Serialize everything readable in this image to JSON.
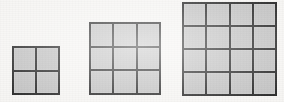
{
  "figure": {
    "background_color": "#f6f5f3",
    "line_color": "#262626",
    "cell_fill_color": "#c2c2c2",
    "cell_size_px": 24,
    "line_width_px": 2,
    "baseline_y_px": 95
  },
  "chart_data": {
    "type": "diagram",
    "categories": [
      "Figure 1",
      "Figure 2",
      "Figure 3"
    ],
    "values": [
      4,
      9,
      16
    ],
    "xlabel": "",
    "ylabel": "Number of small squares",
    "grid": true,
    "legend": false,
    "shapes": [
      {
        "name": "grid-2x2",
        "label": "Figure 1",
        "rows": 2,
        "columns": 2,
        "cell_count": 4,
        "side_length_cells": 2,
        "x_px": 12,
        "y_px": 46,
        "width_px": 48,
        "height_px": 49
      },
      {
        "name": "grid-3x3",
        "label": "Figure 2",
        "rows": 3,
        "columns": 3,
        "cell_count": 9,
        "side_length_cells": 3,
        "x_px": 89,
        "y_px": 22,
        "width_px": 72,
        "height_px": 73
      },
      {
        "name": "grid-4x4",
        "label": "Figure 3",
        "rows": 4,
        "columns": 4,
        "cell_count": 16,
        "side_length_cells": 4,
        "x_px": 182,
        "y_px": 2,
        "width_px": 95,
        "height_px": 94
      }
    ]
  }
}
